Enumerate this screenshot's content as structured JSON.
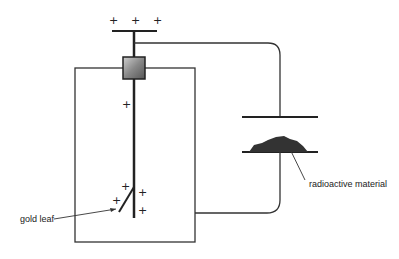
{
  "diagram": {
    "labels": {
      "gold_leaf": "gold leaf",
      "radioactive_material": "radioactive material"
    },
    "charges": {
      "symbol": "+",
      "top_cap": [
        "+",
        "+",
        "+"
      ],
      "rod": [
        "+"
      ],
      "leaf": [
        "+",
        "+"
      ],
      "rod_lower": [
        "+",
        "+"
      ]
    },
    "colors": {
      "line": "#222222",
      "insulator_light": "#cccccc",
      "insulator_dark": "#555555",
      "radioactive": "#333333"
    }
  }
}
